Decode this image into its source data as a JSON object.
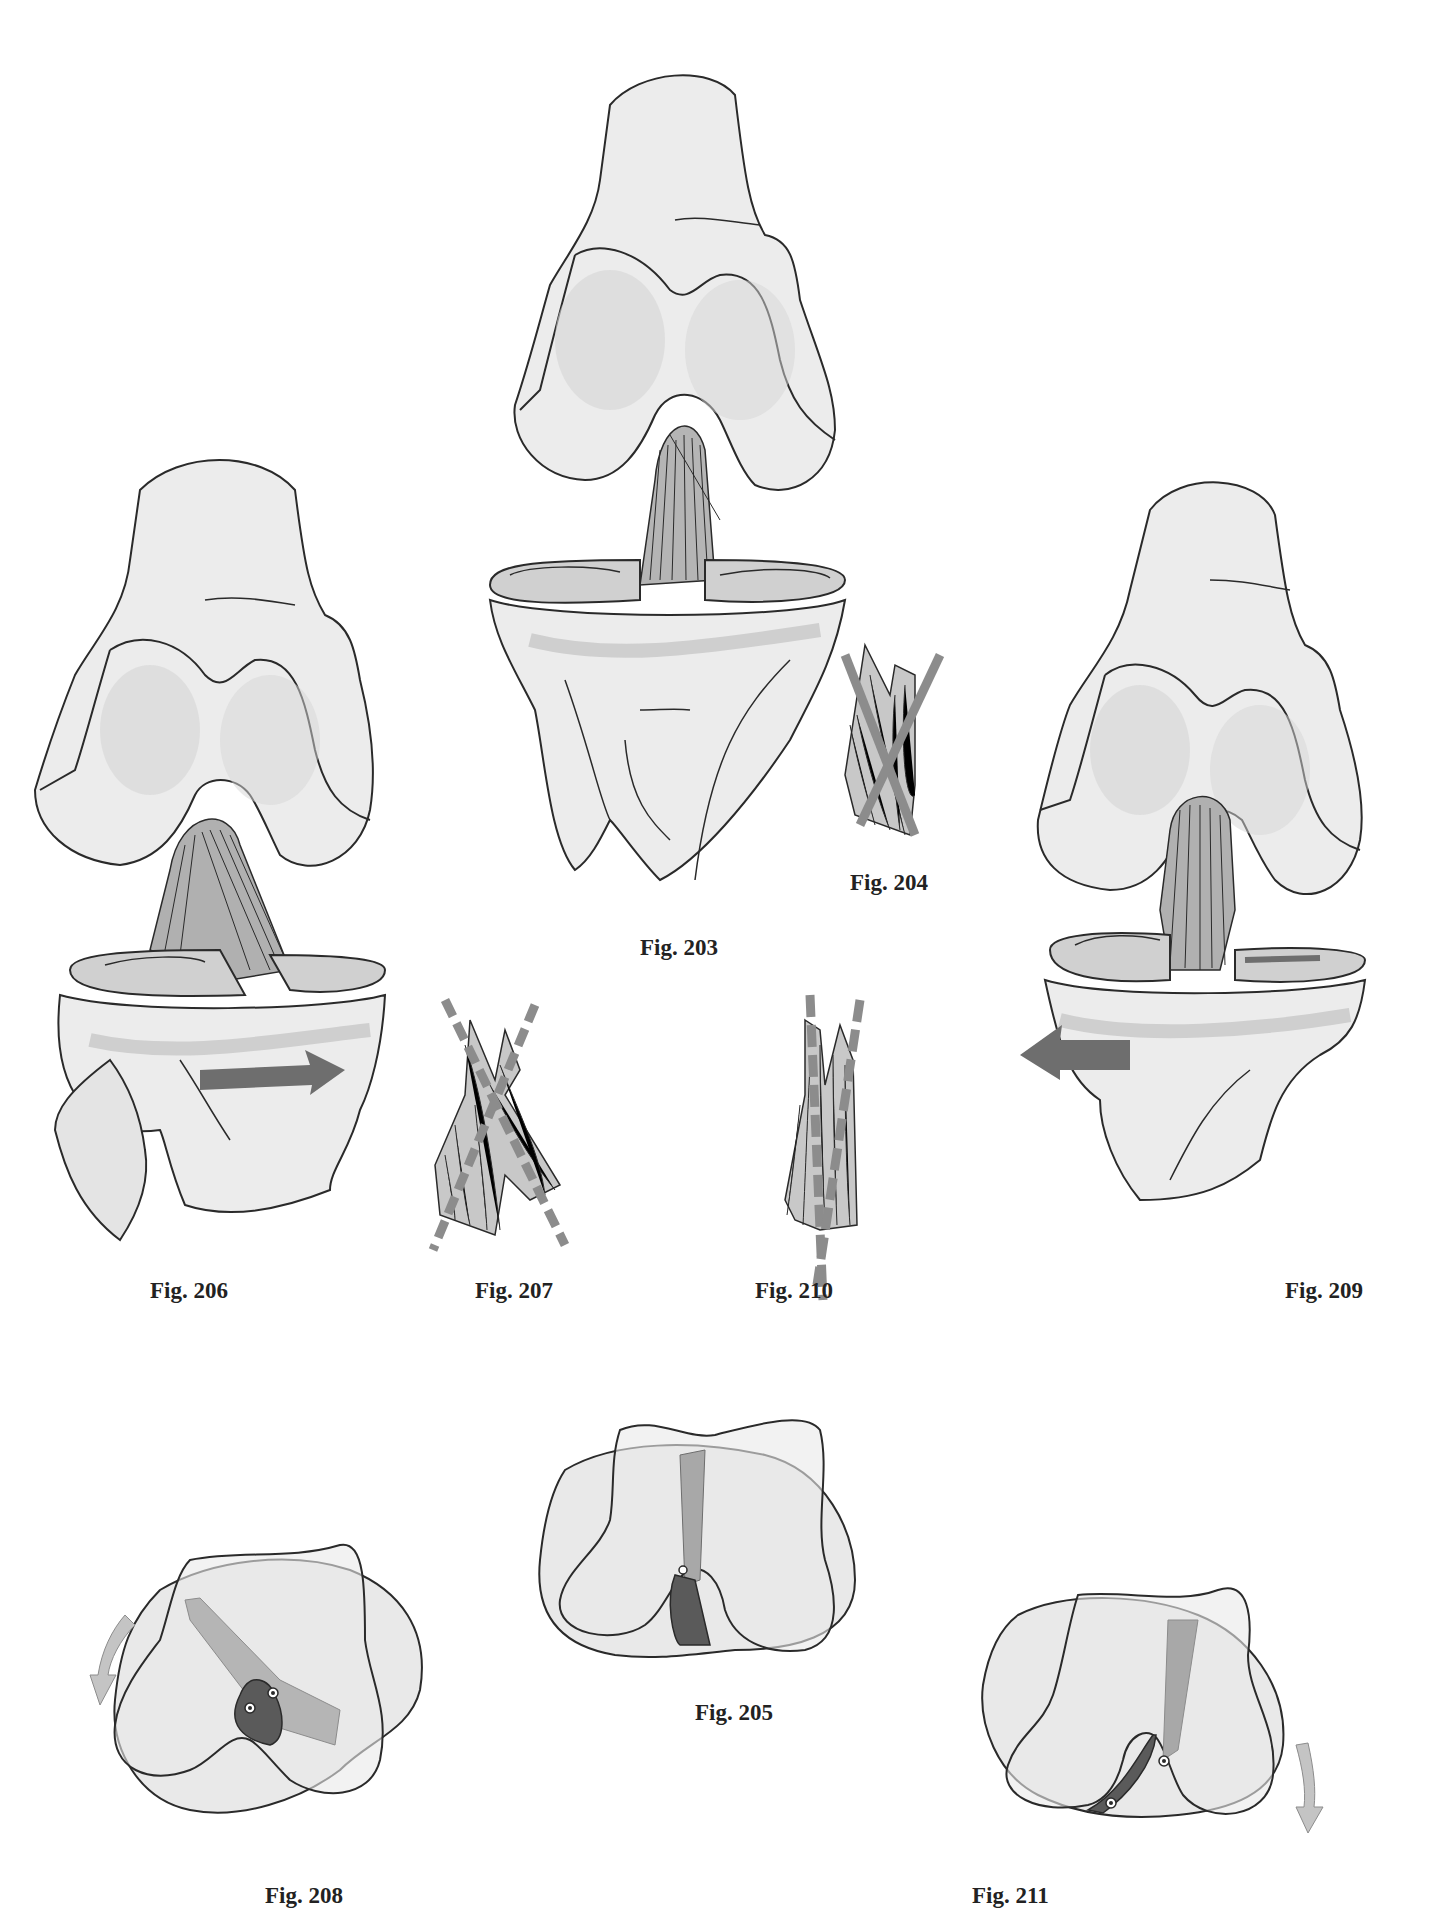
{
  "page": {
    "background": "#ffffff",
    "colors": {
      "bone_fill": "#ececec",
      "bone_shadow": "#d4d4d4",
      "outline": "#2a2a2a",
      "ligament_light": "#a8a8a8",
      "ligament_dark": "#5a5a5a",
      "rotation_arrow_dark": "#6e6e6e",
      "rotation_arrow_light": "#c4c4c4",
      "axis_line": "#8c8c8c"
    }
  },
  "figures": [
    {
      "id": "fig-203",
      "label": "Fig. 203",
      "content": "Anterior view of knee joint (femur, tibia, fibula, menisci, crossed cruciate ligaments) in neutral position"
    },
    {
      "id": "fig-204",
      "label": "Fig. 204",
      "content": "Detail of crossed cruciate ligaments with two crossing axis bars (neutral)"
    },
    {
      "id": "fig-205",
      "label": "Fig. 205",
      "content": "Superior view of tibial plateau outline overlaid with femoral condyles; light and dark ligament insertions, neutral"
    },
    {
      "id": "fig-206",
      "label": "Fig. 206",
      "content": "Knee joint with tibia in medial rotation; cruciates wind around each other",
      "arrow": "right"
    },
    {
      "id": "fig-207",
      "label": "Fig. 207",
      "content": "Cruciate ligaments crossing more (dashed axis lines forming an X)"
    },
    {
      "id": "fig-208",
      "label": "Fig. 208",
      "content": "Superior view rotated; tibial outline rotated relative to condyles; rotation arrow counter-clockwise",
      "arrow": "curved-down-left"
    },
    {
      "id": "fig-209",
      "label": "Fig. 209",
      "content": "Knee joint with tibia in lateral rotation; cruciates become parallel",
      "arrow": "left"
    },
    {
      "id": "fig-210",
      "label": "Fig. 210",
      "content": "Cruciate ligaments nearly parallel (dashed axis lines nearly vertical)"
    },
    {
      "id": "fig-211",
      "label": "Fig. 211",
      "content": "Superior view rotated the other way; rotation arrow clockwise",
      "arrow": "curved-down"
    }
  ]
}
